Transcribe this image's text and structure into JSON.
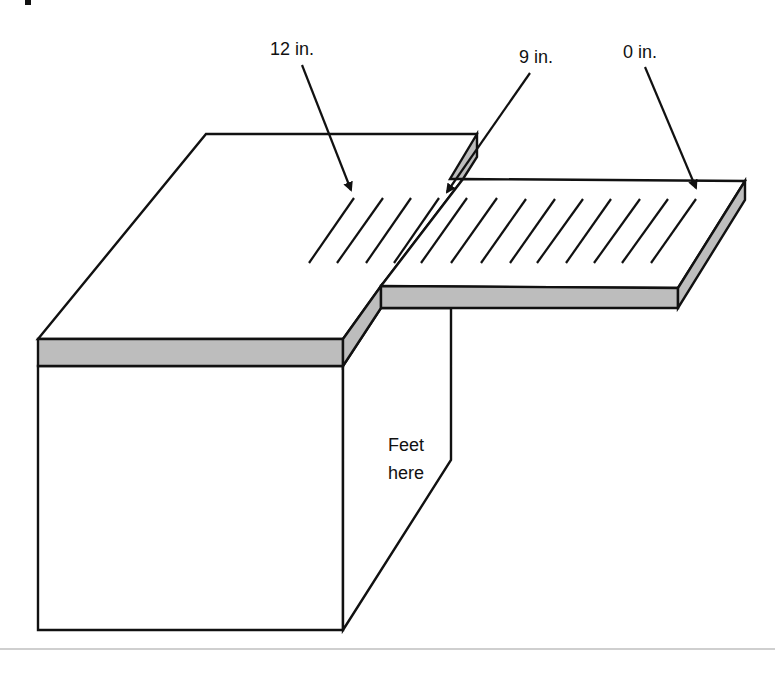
{
  "diagram": {
    "labels": {
      "mark_12": "12 in.",
      "mark_9": "9 in.",
      "mark_0": "0 in.",
      "feet_line1": "Feet",
      "feet_line2": "here"
    },
    "ruler": {
      "tick_count": 13,
      "first_tick_top_x": 354,
      "tick_spacing_px": 28.5
    },
    "colors": {
      "outline": "#111111",
      "side_face": "#bdbdbd",
      "background": "#ffffff",
      "divider": "#bfbfbf"
    }
  }
}
